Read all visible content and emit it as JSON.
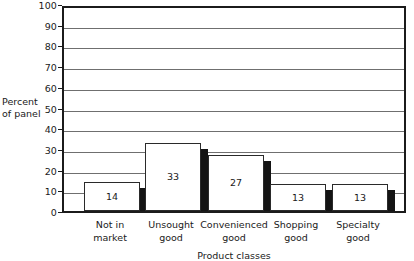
{
  "chart_data": {
    "type": "bar",
    "title": "",
    "subtitle": "",
    "xlabel": "Product classes",
    "ylabel": "Percent of panel",
    "ylabel_line1": "Percent",
    "ylabel_line2": "of panel",
    "categories": [
      "Not in market",
      "Unsought good",
      "Convenienced good",
      "Shopping good",
      "Specialty good"
    ],
    "category_lines": [
      [
        "Not in",
        "market"
      ],
      [
        "Unsought",
        "good"
      ],
      [
        "Convenienced",
        "good"
      ],
      [
        "Shopping",
        "good"
      ],
      [
        "Specialty",
        "good"
      ]
    ],
    "values": [
      14,
      33,
      27,
      13,
      13
    ],
    "value_labels": [
      "14",
      "33",
      "27",
      "13",
      "13"
    ],
    "ylim": [
      0,
      100
    ],
    "ytick_step": 10,
    "yticks": [
      0,
      10,
      20,
      30,
      40,
      50,
      60,
      70,
      80,
      90,
      100
    ],
    "ytick_labels": [
      "0",
      "10",
      "20",
      "30",
      "40",
      "50",
      "60",
      "70",
      "80",
      "90",
      "100"
    ],
    "grid": true,
    "grid_orientation": "horizontal",
    "legend": false,
    "legend_position": "none",
    "bar_style": "3d-drop-shadow",
    "colors": {
      "bar_fill": "#ffffff",
      "bar_outline": "#2a2a2a",
      "bar_shadow": "#141414",
      "gridline": "#6f6f6f",
      "axis": "#1b1b1b",
      "text": "#1a1a1a",
      "background": "#ffffff"
    }
  }
}
